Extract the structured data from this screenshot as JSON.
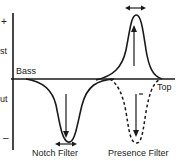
{
  "diagram": {
    "axis": {
      "top_symbol": "+",
      "bottom_symbol": "–",
      "boost_label": "st",
      "cut_label": "ut"
    },
    "baseline": {
      "left_label": "Bass",
      "right_label": "Top"
    },
    "filters": [
      {
        "name": "Notch Filter",
        "direction": "cut",
        "width_arrow": true
      },
      {
        "name": "Presence Filter",
        "direction": "boost",
        "width_arrow": true,
        "dashed_cut_variant": true
      }
    ],
    "colors": {
      "line": "#1a1a1a",
      "background": "#ffffff"
    }
  }
}
